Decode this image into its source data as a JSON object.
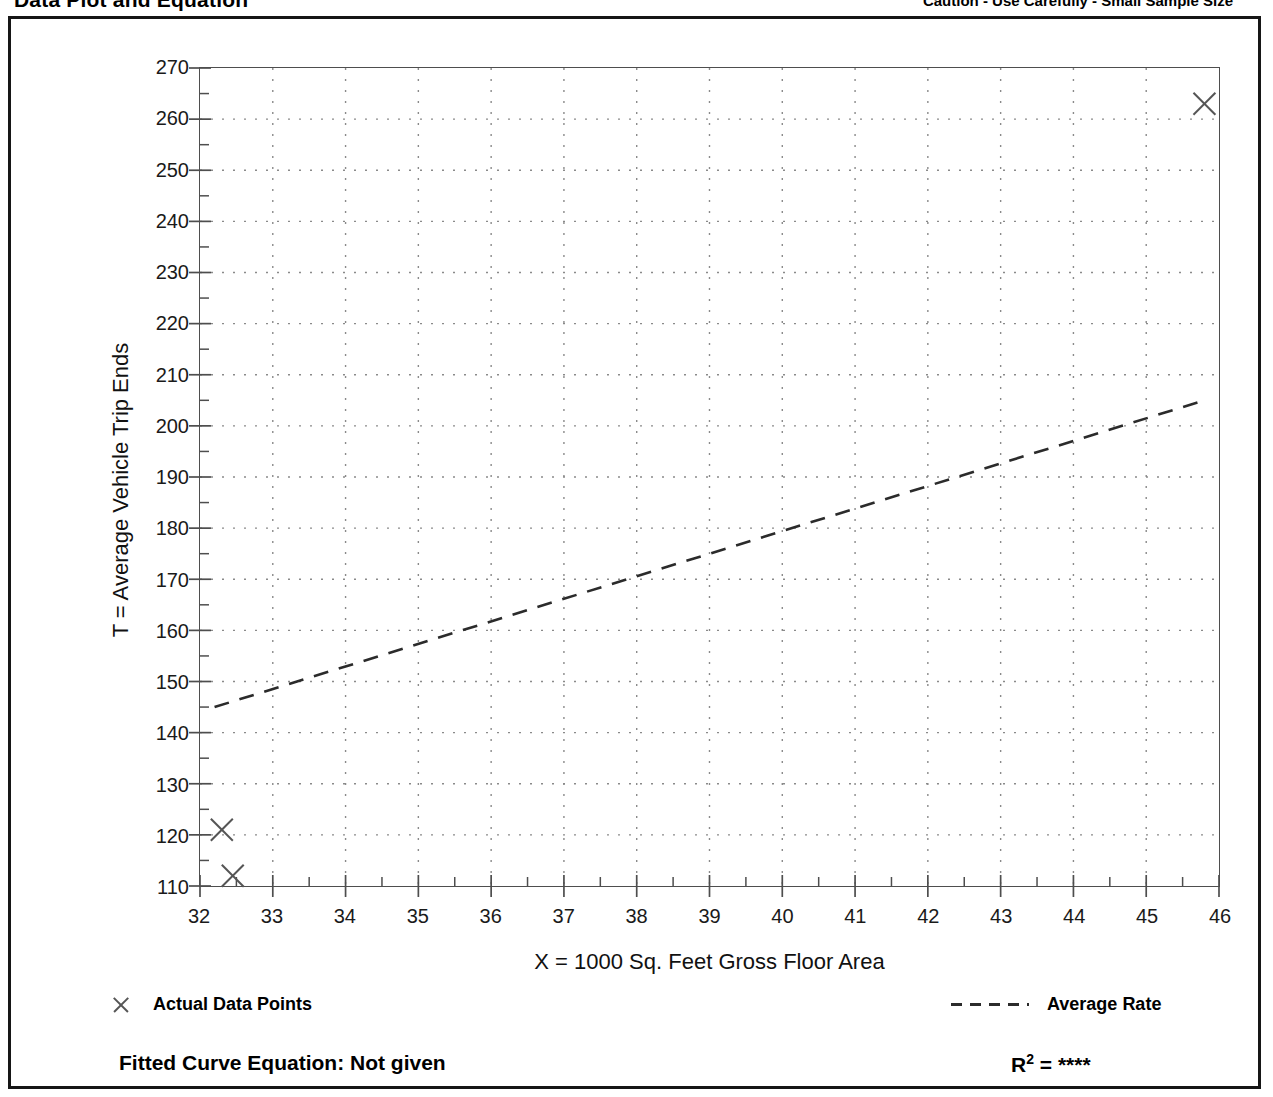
{
  "header": {
    "title": "Data Plot and Equation",
    "caution": "Caution - Use Carefully - Small Sample Size"
  },
  "legend": {
    "data_points_label": "Actual Data Points",
    "average_rate_label": "Average Rate",
    "data_points_marker": "x-marker-icon",
    "average_rate_marker": "dashed-line-icon"
  },
  "footer": {
    "equation_label": "Fitted Curve Equation:  Not given",
    "r2_label": "R",
    "r2_exponent": "2",
    "r2_equals": " = ",
    "r2_value": "****"
  },
  "chart_data": {
    "type": "scatter",
    "title": "Data Plot and Equation",
    "xlabel": "X = 1000 Sq. Feet Gross Floor Area",
    "ylabel": "T = Average Vehicle Trip Ends",
    "xlim": [
      32,
      46
    ],
    "ylim": [
      110,
      270
    ],
    "xticks": [
      32,
      33,
      34,
      35,
      36,
      37,
      38,
      39,
      40,
      41,
      42,
      43,
      44,
      45,
      46
    ],
    "yticks": [
      110,
      120,
      130,
      140,
      150,
      160,
      170,
      180,
      190,
      200,
      210,
      220,
      230,
      240,
      250,
      260,
      270
    ],
    "xminor_step": 0.5,
    "yminor_step": 5,
    "grid": "dotted-both-axes",
    "legend_position": "below-plot",
    "series": [
      {
        "name": "Actual Data Points",
        "type": "scatter",
        "marker": "x",
        "color": "#555555",
        "points": [
          {
            "x": 32.3,
            "y": 121
          },
          {
            "x": 32.45,
            "y": 112
          },
          {
            "x": 45.8,
            "y": 263
          }
        ]
      },
      {
        "name": "Average Rate",
        "type": "line",
        "style": "dashed",
        "color": "#2b2b2b",
        "points": [
          {
            "x": 32.2,
            "y": 145
          },
          {
            "x": 45.8,
            "y": 205
          }
        ]
      }
    ]
  }
}
